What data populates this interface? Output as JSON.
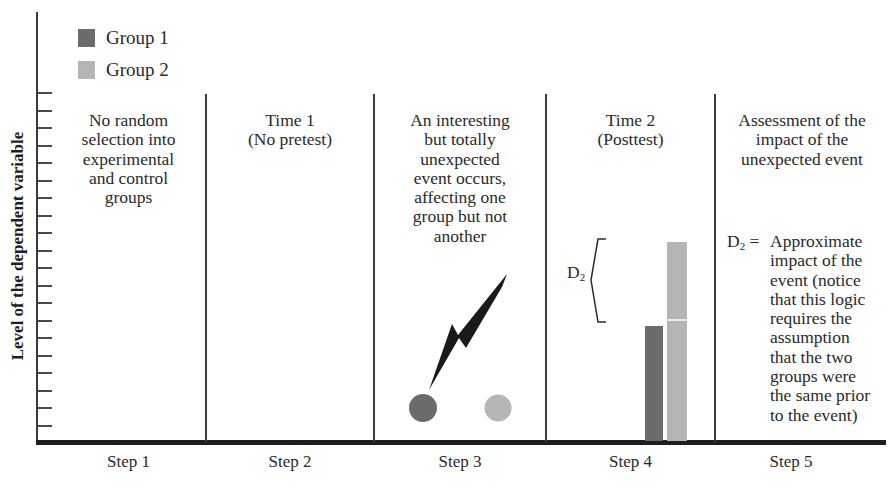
{
  "colors": {
    "group1": "#6b6b6b",
    "group2": "#b5b5b5",
    "axis": "#1e1e1e"
  },
  "y_axis": {
    "label": "Level of the dependent variable",
    "tick_count": 20
  },
  "legend": [
    {
      "label": "Group 1",
      "color": "#6b6b6b"
    },
    {
      "label": "Group 2",
      "color": "#b5b5b5"
    }
  ],
  "steps": [
    {
      "label": "Step 1",
      "heading_lines": [
        "No random",
        "selection into",
        "experimental",
        "and control",
        "groups"
      ]
    },
    {
      "label": "Step 2",
      "heading_lines": [
        "Time 1",
        "(No pretest)"
      ]
    },
    {
      "label": "Step 3",
      "heading_lines": [
        "An interesting",
        "but totally",
        "unexpected",
        "event occurs,",
        "affecting one",
        "group but not",
        "another"
      ]
    },
    {
      "label": "Step 4",
      "heading_lines": [
        "Time 2",
        "(Posttest)"
      ]
    },
    {
      "label": "Step 5",
      "heading_lines": [
        "Assessment of the",
        "impact of the",
        "unexpected event"
      ]
    }
  ],
  "step3": {
    "event_icon": "lightning-bolt-icon",
    "circles": [
      "group1",
      "group2"
    ]
  },
  "step4": {
    "bracket_label": "D",
    "bracket_subscript": "2",
    "bars": [
      {
        "group": "Group 1",
        "relative_height": 115
      },
      {
        "group": "Group 2",
        "relative_height": 199
      }
    ]
  },
  "step5": {
    "d2_symbol": "D",
    "d2_subscript": "2",
    "d2_equals": "=",
    "d2_lines": [
      "Approximate",
      "impact of the",
      "event (notice",
      "that this logic",
      "requires the",
      "assumption",
      "that the two",
      "groups were",
      "the same prior",
      "to the event)"
    ]
  },
  "chart_data": {
    "type": "bar",
    "title": "",
    "xlabel": "",
    "ylabel": "Level of the dependent variable",
    "categories": [
      "Step 4 (Time 2 Posttest)"
    ],
    "series": [
      {
        "name": "Group 1",
        "values": [
          115
        ]
      },
      {
        "name": "Group 2",
        "values": [
          199
        ]
      }
    ],
    "annotations": [
      "D2 = difference between Group 2 and Group 1 at posttest"
    ],
    "note": "Values are relative pixel heights; axis has unlabeled ticks"
  }
}
